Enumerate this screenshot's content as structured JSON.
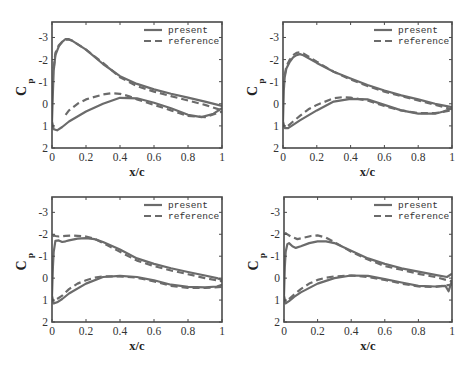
{
  "chart_data": [
    {
      "type": "line",
      "panel": "top-left",
      "xlabel": "x/c",
      "ylabel": "C_p",
      "xlim": [
        0,
        1
      ],
      "ylim": [
        2,
        -3.7
      ],
      "y_inverted": true,
      "xticks": [
        "0",
        "0.2",
        "0.4",
        "0.6",
        "0.8",
        "1"
      ],
      "yticks": [
        "-3",
        "-2",
        "-1",
        "0",
        "1",
        "2"
      ],
      "legend": [
        "present",
        "reference"
      ],
      "legend_position": "upper right",
      "grid": false,
      "series": [
        {
          "name": "present",
          "style": "solid",
          "surface": "upper",
          "x": [
            0,
            0.005,
            0.01,
            0.02,
            0.04,
            0.06,
            0.08,
            0.1,
            0.12,
            0.2,
            0.3,
            0.4,
            0.5,
            0.6,
            0.7,
            0.8,
            0.9,
            1.0
          ],
          "y": [
            0.8,
            -0.5,
            -1.5,
            -2.2,
            -2.6,
            -2.8,
            -2.93,
            -2.92,
            -2.85,
            -2.45,
            -1.8,
            -1.25,
            -0.9,
            -0.65,
            -0.45,
            -0.28,
            -0.1,
            0.1
          ]
        },
        {
          "name": "present",
          "style": "solid",
          "surface": "lower",
          "x": [
            0,
            0.01,
            0.03,
            0.06,
            0.1,
            0.2,
            0.3,
            0.4,
            0.5,
            0.6,
            0.7,
            0.8,
            0.88,
            0.95,
            1.0
          ],
          "y": [
            0.8,
            1.15,
            1.2,
            1.05,
            0.8,
            0.35,
            0.0,
            -0.27,
            -0.25,
            -0.05,
            0.2,
            0.5,
            0.6,
            0.45,
            0.2
          ]
        },
        {
          "name": "reference",
          "style": "dashed",
          "surface": "upper",
          "x": [
            0.01,
            0.02,
            0.04,
            0.06,
            0.08,
            0.1,
            0.12,
            0.2,
            0.3,
            0.4,
            0.5,
            0.6,
            0.7,
            0.8,
            0.9,
            1.0
          ],
          "y": [
            -1.6,
            -2.3,
            -2.65,
            -2.8,
            -2.9,
            -2.9,
            -2.85,
            -2.45,
            -1.85,
            -1.2,
            -0.8,
            -0.55,
            -0.35,
            -0.15,
            0.05,
            0.3
          ]
        },
        {
          "name": "reference",
          "style": "dashed",
          "surface": "lower",
          "x": [
            0.08,
            0.1,
            0.15,
            0.2,
            0.3,
            0.35,
            0.4,
            0.45,
            0.5,
            0.6,
            0.7,
            0.8,
            0.9,
            1.0
          ],
          "y": [
            0.5,
            0.3,
            0.0,
            -0.2,
            -0.42,
            -0.48,
            -0.45,
            -0.35,
            -0.2,
            0.05,
            0.3,
            0.55,
            0.6,
            0.35
          ]
        }
      ]
    },
    {
      "type": "line",
      "panel": "top-right",
      "xlabel": "x/c",
      "ylabel": "C_p",
      "xlim": [
        0,
        1
      ],
      "ylim": [
        2,
        -3.7
      ],
      "y_inverted": true,
      "xticks": [
        "0",
        "0.2",
        "0.4",
        "0.6",
        "0.8",
        "1"
      ],
      "yticks": [
        "-3",
        "-2",
        "-1",
        "0",
        "1",
        "2"
      ],
      "legend": [
        "present",
        "reference"
      ],
      "legend_position": "upper right",
      "grid": false,
      "series": [
        {
          "name": "present",
          "style": "solid",
          "surface": "upper",
          "x": [
            0,
            0.005,
            0.01,
            0.02,
            0.04,
            0.06,
            0.08,
            0.1,
            0.12,
            0.2,
            0.3,
            0.4,
            0.5,
            0.6,
            0.7,
            0.8,
            0.9,
            1.0
          ],
          "y": [
            0.8,
            -0.6,
            -1.2,
            -1.6,
            -1.9,
            -2.1,
            -2.2,
            -2.25,
            -2.2,
            -1.85,
            -1.45,
            -1.15,
            -0.85,
            -0.6,
            -0.38,
            -0.2,
            0.0,
            0.15
          ]
        },
        {
          "name": "present",
          "style": "solid",
          "surface": "lower",
          "x": [
            0,
            0.01,
            0.03,
            0.06,
            0.1,
            0.2,
            0.3,
            0.4,
            0.5,
            0.6,
            0.7,
            0.8,
            0.9,
            0.95,
            1.0
          ],
          "y": [
            0.8,
            1.1,
            1.1,
            0.95,
            0.75,
            0.3,
            -0.1,
            -0.22,
            -0.2,
            0.05,
            0.3,
            0.45,
            0.45,
            0.35,
            0.2
          ]
        },
        {
          "name": "reference",
          "style": "dashed",
          "surface": "upper",
          "x": [
            0.01,
            0.02,
            0.04,
            0.06,
            0.08,
            0.1,
            0.12,
            0.2,
            0.3,
            0.4,
            0.5,
            0.6,
            0.7,
            0.8,
            0.9,
            1.0
          ],
          "y": [
            -1.3,
            -1.7,
            -2.0,
            -2.2,
            -2.3,
            -2.33,
            -2.28,
            -1.9,
            -1.45,
            -1.1,
            -0.8,
            -0.55,
            -0.35,
            -0.15,
            0.05,
            0.25
          ]
        },
        {
          "name": "reference",
          "style": "dashed",
          "surface": "lower",
          "x": [
            0.03,
            0.06,
            0.1,
            0.15,
            0.2,
            0.3,
            0.35,
            0.4,
            0.5,
            0.6,
            0.7,
            0.8,
            0.9,
            1.0
          ],
          "y": [
            1.0,
            0.8,
            0.55,
            0.25,
            0.05,
            -0.25,
            -0.3,
            -0.28,
            -0.15,
            0.1,
            0.3,
            0.42,
            0.42,
            0.3
          ]
        }
      ]
    },
    {
      "type": "line",
      "panel": "bottom-left",
      "xlabel": "x/c",
      "ylabel": "C_p",
      "xlim": [
        0,
        1
      ],
      "ylim": [
        2,
        -3.7
      ],
      "y_inverted": true,
      "xticks": [
        "0",
        "0.2",
        "0.4",
        "0.6",
        "0.8",
        "1"
      ],
      "yticks": [
        "-3",
        "-2",
        "-1",
        "0",
        "1",
        "2"
      ],
      "legend": [
        "present",
        "reference"
      ],
      "legend_position": "upper right",
      "grid": false,
      "series": [
        {
          "name": "present",
          "style": "solid",
          "surface": "upper",
          "x": [
            0,
            0.005,
            0.01,
            0.02,
            0.04,
            0.06,
            0.08,
            0.1,
            0.15,
            0.2,
            0.25,
            0.3,
            0.4,
            0.5,
            0.6,
            0.7,
            0.8,
            0.9,
            0.97,
            1.0
          ],
          "y": [
            0.8,
            -0.5,
            -1.2,
            -1.7,
            -1.72,
            -1.65,
            -1.68,
            -1.72,
            -1.8,
            -1.82,
            -1.78,
            -1.65,
            -1.3,
            -0.9,
            -0.65,
            -0.45,
            -0.28,
            -0.12,
            0.0,
            0.1
          ]
        },
        {
          "name": "present",
          "style": "solid",
          "surface": "lower",
          "x": [
            0,
            0.01,
            0.03,
            0.06,
            0.1,
            0.2,
            0.3,
            0.4,
            0.5,
            0.6,
            0.7,
            0.8,
            0.9,
            0.97,
            1.0
          ],
          "y": [
            0.8,
            1.15,
            1.1,
            0.95,
            0.7,
            0.25,
            -0.05,
            -0.1,
            -0.05,
            0.1,
            0.3,
            0.4,
            0.42,
            0.38,
            0.3
          ]
        },
        {
          "name": "reference",
          "style": "dashed",
          "surface": "upper",
          "x": [
            0.005,
            0.01,
            0.02,
            0.04,
            0.08,
            0.12,
            0.2,
            0.25,
            0.3,
            0.4,
            0.5,
            0.6,
            0.7,
            0.8,
            0.9,
            1.0
          ],
          "y": [
            -1.9,
            -1.95,
            -1.92,
            -1.9,
            -1.93,
            -1.95,
            -1.9,
            -1.8,
            -1.6,
            -1.2,
            -0.8,
            -0.55,
            -0.35,
            -0.18,
            0.0,
            0.15
          ]
        },
        {
          "name": "reference",
          "style": "dashed",
          "surface": "lower",
          "x": [
            0.03,
            0.06,
            0.1,
            0.15,
            0.2,
            0.25,
            0.3,
            0.4,
            0.5,
            0.6,
            0.7,
            0.8,
            0.9,
            1.0
          ],
          "y": [
            0.95,
            0.8,
            0.5,
            0.25,
            0.1,
            -0.02,
            -0.08,
            -0.08,
            -0.02,
            0.15,
            0.35,
            0.45,
            0.45,
            0.4
          ]
        }
      ]
    },
    {
      "type": "line",
      "panel": "bottom-right",
      "xlabel": "x/c",
      "ylabel": "C_p",
      "xlim": [
        0,
        1
      ],
      "ylim": [
        2,
        -3.7
      ],
      "y_inverted": true,
      "xticks": [
        "0",
        "0.2",
        "0.4",
        "0.6",
        "0.8",
        "1"
      ],
      "yticks": [
        "-3",
        "-2",
        "-1",
        "0",
        "1",
        "2"
      ],
      "legend": [
        "present",
        "reference"
      ],
      "legend_position": "upper right",
      "grid": false,
      "series": [
        {
          "name": "present",
          "style": "solid",
          "surface": "upper",
          "x": [
            0,
            0.005,
            0.01,
            0.02,
            0.03,
            0.05,
            0.07,
            0.1,
            0.15,
            0.2,
            0.25,
            0.3,
            0.4,
            0.5,
            0.6,
            0.7,
            0.8,
            0.9,
            0.97,
            1.0
          ],
          "y": [
            0.8,
            -0.5,
            -1.2,
            -1.55,
            -1.6,
            -1.45,
            -1.38,
            -1.45,
            -1.6,
            -1.68,
            -1.68,
            -1.6,
            -1.25,
            -0.9,
            -0.65,
            -0.45,
            -0.3,
            -0.15,
            -0.05,
            -0.2
          ]
        },
        {
          "name": "present",
          "style": "solid",
          "surface": "lower",
          "x": [
            0,
            0.01,
            0.03,
            0.06,
            0.1,
            0.2,
            0.3,
            0.4,
            0.5,
            0.6,
            0.7,
            0.8,
            0.9,
            0.96,
            0.98,
            1.0
          ],
          "y": [
            0.8,
            1.15,
            1.05,
            0.85,
            0.65,
            0.25,
            0.0,
            -0.12,
            -0.1,
            0.05,
            0.2,
            0.35,
            0.38,
            0.35,
            0.6,
            0.1
          ]
        },
        {
          "name": "reference",
          "style": "dashed",
          "surface": "upper",
          "x": [
            0.005,
            0.01,
            0.02,
            0.04,
            0.08,
            0.12,
            0.16,
            0.2,
            0.25,
            0.3,
            0.4,
            0.5,
            0.6,
            0.7,
            0.8,
            0.9,
            1.0
          ],
          "y": [
            -2.0,
            -2.05,
            -2.0,
            -1.9,
            -1.78,
            -1.85,
            -1.92,
            -1.95,
            -1.85,
            -1.65,
            -1.2,
            -0.85,
            -0.55,
            -0.38,
            -0.2,
            -0.05,
            0.15
          ]
        },
        {
          "name": "reference",
          "style": "dashed",
          "surface": "lower",
          "x": [
            0.03,
            0.06,
            0.1,
            0.15,
            0.2,
            0.25,
            0.3,
            0.4,
            0.5,
            0.6,
            0.7,
            0.8,
            0.9,
            1.0
          ],
          "y": [
            0.95,
            0.75,
            0.5,
            0.25,
            0.08,
            -0.02,
            -0.08,
            -0.12,
            -0.05,
            0.08,
            0.25,
            0.38,
            0.4,
            0.3
          ]
        }
      ]
    }
  ],
  "panels": [
    {
      "id": "top-left",
      "legend_present": "present",
      "legend_reference": "reference",
      "xlabel": "x/c",
      "ylabel_main": "C",
      "ylabel_sub": "p"
    },
    {
      "id": "top-right",
      "legend_present": "present",
      "legend_reference": "reference",
      "xlabel": "x/c",
      "ylabel_main": "C",
      "ylabel_sub": "p"
    },
    {
      "id": "bottom-left",
      "legend_present": "present",
      "legend_reference": "reference",
      "xlabel": "x/c",
      "ylabel_main": "C",
      "ylabel_sub": "p"
    },
    {
      "id": "bottom-right",
      "legend_present": "present",
      "legend_reference": "reference",
      "xlabel": "x/c",
      "ylabel_main": "C",
      "ylabel_sub": "p"
    }
  ],
  "colors": {
    "line": "#6b6b6b",
    "axis": "#4a4a4a",
    "text": "#333333"
  }
}
